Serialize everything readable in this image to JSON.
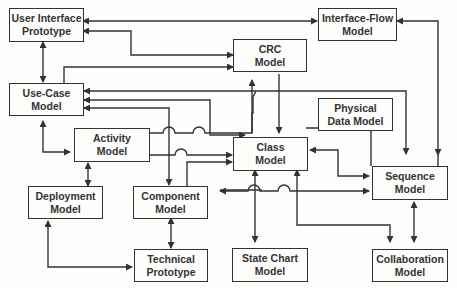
{
  "nodes": [
    {
      "id": "uip",
      "label": "User Interface\nPrototype"
    },
    {
      "id": "ifm",
      "label": "Interface-Flow\nModel"
    },
    {
      "id": "crc",
      "label": "CRC\nModel"
    },
    {
      "id": "ucm",
      "label": "Use-Case\nModel"
    },
    {
      "id": "pdm",
      "label": "Physical\nData Model"
    },
    {
      "id": "act",
      "label": "Activity\nModel"
    },
    {
      "id": "cls",
      "label": "Class\nModel"
    },
    {
      "id": "seq",
      "label": "Sequence\nModel"
    },
    {
      "id": "dep",
      "label": "Deployment\nModel"
    },
    {
      "id": "cmp",
      "label": "Component\nModel"
    },
    {
      "id": "tec",
      "label": "Technical\nPrototype"
    },
    {
      "id": "stc",
      "label": "State Chart\nModel"
    },
    {
      "id": "col",
      "label": "Collaboration\nModel"
    }
  ]
}
